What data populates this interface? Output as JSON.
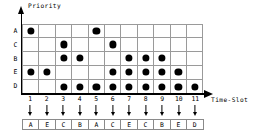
{
  "chart_data": {
    "type": "scatter",
    "title": "",
    "xlabel": "Time-Slot",
    "ylabel": "Priority",
    "x": [
      1,
      2,
      3,
      4,
      5,
      6,
      7,
      8,
      9,
      10,
      11
    ],
    "categories": [
      "A",
      "C",
      "B",
      "E",
      "D"
    ],
    "grid": true,
    "legend": "none",
    "series": [
      {
        "name": "A",
        "slots": [
          1,
          5
        ]
      },
      {
        "name": "C",
        "slots": [
          3,
          6
        ]
      },
      {
        "name": "B",
        "slots": [
          3,
          4,
          7,
          8,
          9
        ]
      },
      {
        "name": "E",
        "slots": [
          1,
          2,
          6,
          7,
          8,
          9,
          10
        ]
      },
      {
        "name": "D",
        "slots": [
          3,
          4,
          5,
          6,
          7,
          8,
          9,
          10,
          11
        ]
      }
    ],
    "matrix": [
      [
        1,
        0,
        0,
        0,
        1,
        0,
        0,
        0,
        0,
        0,
        0
      ],
      [
        0,
        0,
        1,
        0,
        0,
        1,
        0,
        0,
        0,
        0,
        0
      ],
      [
        0,
        0,
        1,
        1,
        0,
        0,
        1,
        1,
        1,
        0,
        0
      ],
      [
        1,
        1,
        0,
        0,
        0,
        1,
        1,
        1,
        1,
        1,
        0
      ],
      [
        0,
        0,
        1,
        1,
        1,
        1,
        1,
        1,
        1,
        1,
        1
      ]
    ],
    "annotations": [
      "A",
      "E",
      "C",
      "B",
      "A",
      "C",
      "E",
      "C",
      "B",
      "E",
      "D"
    ]
  },
  "axes": {
    "y_title": "Priority",
    "x_title": "Time-Slot",
    "y_labels": [
      "A",
      "C",
      "B",
      "E",
      "D"
    ],
    "x_labels": [
      "1",
      "2",
      "3",
      "4",
      "5",
      "6",
      "7",
      "8",
      "9",
      "10",
      "11"
    ]
  },
  "assignment": {
    "cells": [
      "A",
      "E",
      "C",
      "B",
      "A",
      "C",
      "E",
      "C",
      "B",
      "E",
      "D"
    ]
  },
  "colors": {
    "dot": "#000000",
    "grid": "#9a9a9a",
    "axis": "#000000",
    "background": "#ffffff"
  }
}
